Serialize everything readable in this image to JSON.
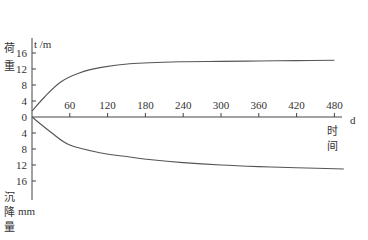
{
  "chart_data": {
    "type": "line",
    "title": "",
    "xlabel": "时间",
    "x_unit": "d",
    "ylabel_top": "荷重",
    "ylabel_top_unit": "t /m",
    "ylabel_bottom": "沉降量",
    "ylabel_bottom_unit": "mm",
    "x_ticks": [
      60,
      120,
      180,
      240,
      300,
      360,
      420,
      480
    ],
    "y_ticks_top": [
      0,
      4,
      8,
      12,
      16
    ],
    "y_ticks_bottom": [
      4,
      8,
      12,
      16
    ],
    "xlim": [
      0,
      500
    ],
    "ylim_top": [
      0,
      20
    ],
    "ylim_bottom": [
      0,
      20
    ],
    "grid": false,
    "legend": null,
    "series": [
      {
        "name": "荷重 (load, t/m)",
        "direction": "up",
        "x": [
          0,
          20,
          45,
          75,
          110,
          155,
          235,
          300,
          360,
          420,
          480
        ],
        "values": [
          1.5,
          5.0,
          8.7,
          11.0,
          12.4,
          13.3,
          13.8,
          13.9,
          14.0,
          14.1,
          14.2
        ]
      },
      {
        "name": "沉降量 (settlement, mm)",
        "direction": "down",
        "x": [
          0,
          30,
          60,
          110,
          155,
          190,
          240,
          300,
          360,
          420,
          495
        ],
        "values": [
          0,
          3.8,
          7.0,
          9.0,
          10.0,
          10.7,
          11.4,
          12.0,
          12.4,
          12.7,
          13.0
        ]
      }
    ]
  }
}
